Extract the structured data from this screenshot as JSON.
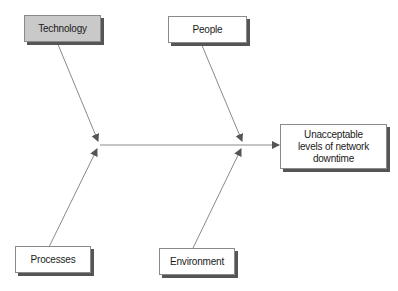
{
  "diagram": {
    "type": "fishbone",
    "effect": {
      "label": "Unacceptable levels of network downtime",
      "lines": [
        "Unacceptable",
        "levels of network",
        "downtime"
      ]
    },
    "causes": [
      {
        "id": "technology",
        "label": "Technology",
        "position": "top-left",
        "highlighted": true
      },
      {
        "id": "people",
        "label": "People",
        "position": "top-right",
        "highlighted": false
      },
      {
        "id": "processes",
        "label": "Processes",
        "position": "bottom-left",
        "highlighted": false
      },
      {
        "id": "environment",
        "label": "Environment",
        "position": "bottom-right",
        "highlighted": false
      }
    ],
    "colors": {
      "highlight_fill": "#c9c9c9",
      "box_fill": "#ffffff",
      "shadow": "#555555",
      "line": "#8a8a8a"
    }
  }
}
